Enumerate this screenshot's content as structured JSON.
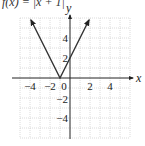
{
  "chart_data": {
    "type": "line",
    "xlabel": "x",
    "ylabel": "y",
    "xlim": [
      -5,
      6
    ],
    "ylim": [
      -6,
      6
    ],
    "grid": true,
    "x_ticks": [
      -4,
      -2,
      0,
      2,
      4
    ],
    "y_ticks": [
      4,
      2,
      -2,
      -4
    ],
    "x_tick_labels": [
      "−4",
      "−2",
      "0",
      "2",
      "4"
    ],
    "y_tick_labels": [
      "4",
      "2",
      "−2",
      "−4"
    ],
    "series": [
      {
        "name": "y = 2|x + 1|",
        "x": [
          -4,
          -1,
          2
        ],
        "y": [
          6,
          0,
          6
        ],
        "arrows": "both ends"
      }
    ],
    "colors": {
      "line": "#333333",
      "grid": "#bdbdbd",
      "axis": "#222222"
    }
  },
  "labels": {
    "formula_fragment": "f(x) = |x + 1|",
    "x_axis": "x",
    "y_axis": "y",
    "x_ticks": [
      "−4",
      "−2",
      "0",
      "2",
      "4"
    ],
    "y_ticks": [
      "4",
      "2",
      "−2",
      "−4"
    ]
  }
}
